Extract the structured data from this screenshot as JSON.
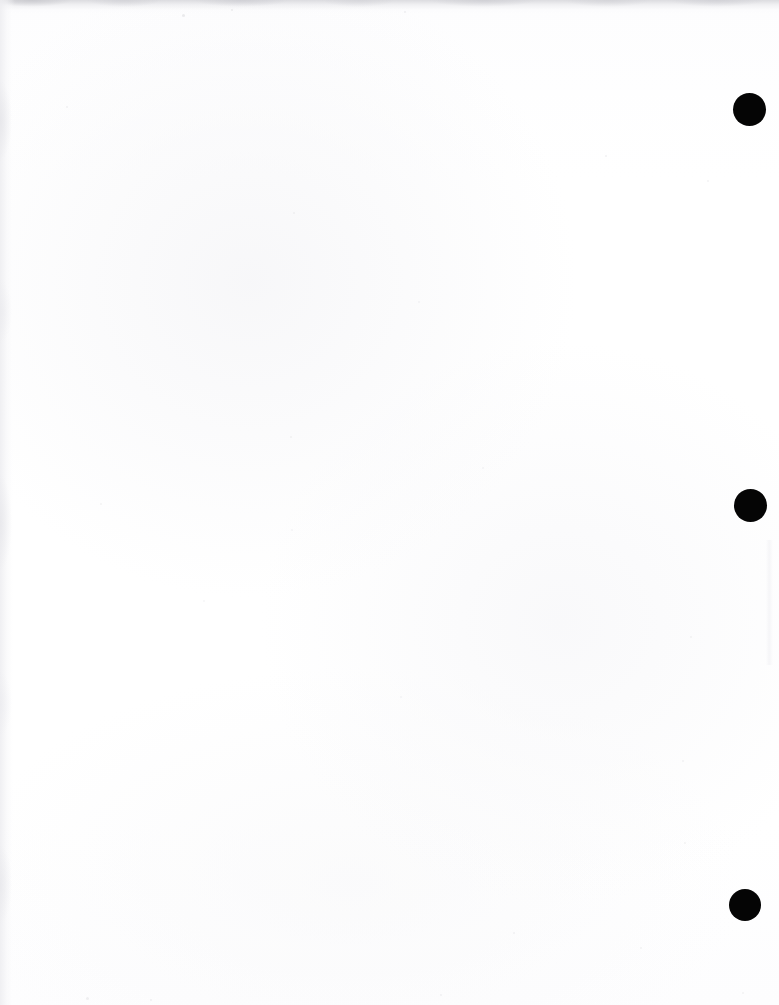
{
  "document": {
    "kind": "scanned-page",
    "orientation": "portrait",
    "page_width_px": 779,
    "page_height_px": 1005,
    "body_text": "",
    "has_text_content": false,
    "description": "Blank scanned document page with three solid black marks in the right margin"
  },
  "colors": {
    "page_background": "#fefefe",
    "paper_tone": "#ffffff",
    "mark_fill": "#050505",
    "scan_shadow": "#d6d6da",
    "scan_streak": "#eeeef1"
  },
  "margin_marks": [
    {
      "name": "margin-mark-top",
      "cx": 749,
      "cy": 109,
      "diameter": 33
    },
    {
      "name": "margin-mark-middle",
      "cx": 750,
      "cy": 505,
      "diameter": 33
    },
    {
      "name": "margin-mark-bottom",
      "cx": 745,
      "cy": 905,
      "diameter": 32
    }
  ],
  "scan_artifacts": [
    {
      "name": "scan-edge-top",
      "edge": "top",
      "thickness": 14
    },
    {
      "name": "scan-edge-left",
      "edge": "left",
      "thickness": 15
    },
    {
      "name": "scan-streak-right",
      "edge": "right",
      "thickness": 7
    }
  ],
  "specks": [
    {
      "x": 182,
      "y": 14,
      "size": 3,
      "opacity": 0.16
    },
    {
      "x": 231,
      "y": 9,
      "size": 2,
      "opacity": 0.14
    },
    {
      "x": 404,
      "y": 11,
      "size": 2,
      "opacity": 0.13
    },
    {
      "x": 66,
      "y": 106,
      "size": 2,
      "opacity": 0.1
    },
    {
      "x": 293,
      "y": 212,
      "size": 2,
      "opacity": 0.09
    },
    {
      "x": 605,
      "y": 155,
      "size": 2,
      "opacity": 0.11
    },
    {
      "x": 707,
      "y": 180,
      "size": 2,
      "opacity": 0.1
    },
    {
      "x": 418,
      "y": 301,
      "size": 2,
      "opacity": 0.08
    },
    {
      "x": 290,
      "y": 436,
      "size": 2,
      "opacity": 0.09
    },
    {
      "x": 100,
      "y": 503,
      "size": 2,
      "opacity": 0.09
    },
    {
      "x": 482,
      "y": 467,
      "size": 2,
      "opacity": 0.08
    },
    {
      "x": 682,
      "y": 760,
      "size": 2,
      "opacity": 0.1
    },
    {
      "x": 291,
      "y": 529,
      "size": 2,
      "opacity": 0.08
    },
    {
      "x": 690,
      "y": 636,
      "size": 2,
      "opacity": 0.09
    },
    {
      "x": 684,
      "y": 842,
      "size": 2,
      "opacity": 0.09
    },
    {
      "x": 203,
      "y": 600,
      "size": 2,
      "opacity": 0.08
    },
    {
      "x": 400,
      "y": 696,
      "size": 2,
      "opacity": 0.08
    },
    {
      "x": 513,
      "y": 932,
      "size": 2,
      "opacity": 0.1
    },
    {
      "x": 640,
      "y": 947,
      "size": 2,
      "opacity": 0.09
    },
    {
      "x": 86,
      "y": 997,
      "size": 3,
      "opacity": 0.12
    },
    {
      "x": 150,
      "y": 999,
      "size": 2,
      "opacity": 0.11
    },
    {
      "x": 440,
      "y": 994,
      "size": 2,
      "opacity": 0.1
    },
    {
      "x": 742,
      "y": 992,
      "size": 2,
      "opacity": 0.09
    }
  ]
}
